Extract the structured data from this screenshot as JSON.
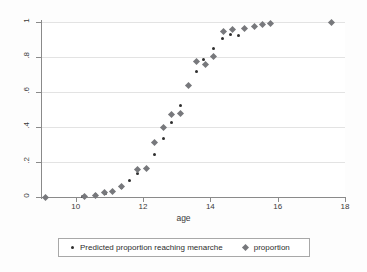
{
  "chart_data": {
    "type": "scatter",
    "title": "",
    "xlabel": "age",
    "ylabel": "",
    "xlim": [
      9.0,
      18.0
    ],
    "ylim": [
      0,
      1
    ],
    "xticks": [
      "10",
      "12",
      "14",
      "16",
      "18"
    ],
    "xtick_values": [
      10,
      12,
      14,
      16,
      18
    ],
    "yticks": [
      "0",
      ".2",
      ".4",
      ".6",
      ".8",
      "1"
    ],
    "ytick_values": [
      0,
      0.2,
      0.4,
      0.6,
      0.8,
      1
    ],
    "grid": "horizontal",
    "legend_position": "bottom",
    "series": [
      {
        "name": "Predicted proportion reaching menarche",
        "marker": "circle",
        "color": "#2f2f2f",
        "points": [
          {
            "x": 10.2,
            "y": 0.005
          },
          {
            "x": 10.6,
            "y": 0.012
          },
          {
            "x": 10.9,
            "y": 0.022
          },
          {
            "x": 11.1,
            "y": 0.033
          },
          {
            "x": 11.35,
            "y": 0.055
          },
          {
            "x": 11.6,
            "y": 0.095
          },
          {
            "x": 11.85,
            "y": 0.135
          },
          {
            "x": 12.1,
            "y": 0.165
          },
          {
            "x": 12.35,
            "y": 0.245
          },
          {
            "x": 12.6,
            "y": 0.335
          },
          {
            "x": 12.85,
            "y": 0.425
          },
          {
            "x": 13.1,
            "y": 0.525
          },
          {
            "x": 13.6,
            "y": 0.72
          },
          {
            "x": 13.8,
            "y": 0.785
          },
          {
            "x": 14.1,
            "y": 0.85
          },
          {
            "x": 14.35,
            "y": 0.905
          },
          {
            "x": 14.6,
            "y": 0.93
          },
          {
            "x": 14.85,
            "y": 0.925
          }
        ]
      },
      {
        "name": "proportion",
        "marker": "diamond",
        "color": "#77787c",
        "points": [
          {
            "x": 9.1,
            "y": 0.0
          },
          {
            "x": 10.25,
            "y": 0.005
          },
          {
            "x": 10.6,
            "y": 0.01
          },
          {
            "x": 10.85,
            "y": 0.025
          },
          {
            "x": 11.1,
            "y": 0.03
          },
          {
            "x": 11.35,
            "y": 0.06
          },
          {
            "x": 11.85,
            "y": 0.155
          },
          {
            "x": 12.1,
            "y": 0.165
          },
          {
            "x": 12.35,
            "y": 0.31
          },
          {
            "x": 12.6,
            "y": 0.395
          },
          {
            "x": 12.85,
            "y": 0.47
          },
          {
            "x": 13.1,
            "y": 0.475
          },
          {
            "x": 13.35,
            "y": 0.635
          },
          {
            "x": 13.6,
            "y": 0.775
          },
          {
            "x": 13.85,
            "y": 0.755
          },
          {
            "x": 14.1,
            "y": 0.805
          },
          {
            "x": 14.4,
            "y": 0.945
          },
          {
            "x": 14.65,
            "y": 0.955
          },
          {
            "x": 15.0,
            "y": 0.965
          },
          {
            "x": 15.3,
            "y": 0.975
          },
          {
            "x": 15.55,
            "y": 0.985
          },
          {
            "x": 15.8,
            "y": 0.99
          },
          {
            "x": 17.6,
            "y": 1.0
          }
        ]
      }
    ]
  },
  "legend": {
    "entries": [
      {
        "label": "Predicted proportion reaching menarche",
        "marker": "circle"
      },
      {
        "label": "proportion",
        "marker": "diamond"
      }
    ]
  }
}
